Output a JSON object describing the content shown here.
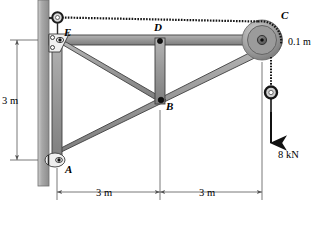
{
  "figure": {
    "background": "#ffffff"
  },
  "colors": {
    "member_fill": "#9a9a9a",
    "member_edge": "#3a3a3a",
    "wall_fill": "#a8a8a8",
    "wall_edge": "#6e6e6e",
    "pulley_outer": "#b8b8b8",
    "pulley_mid": "#8f8f8f",
    "pulley_hub": "#6a6a6a",
    "cable": "#1a1a1a",
    "dimension": "#555555",
    "text": "#000000"
  },
  "joints": [
    {
      "id": "E",
      "label": "E",
      "x": 57,
      "y": 40,
      "type": "pin-eyebolt"
    },
    {
      "id": "D",
      "label": "D",
      "x": 160,
      "y": 40,
      "type": "pin"
    },
    {
      "id": "C",
      "label": "C",
      "x": 262,
      "y": 40,
      "type": "pulley"
    },
    {
      "id": "B",
      "label": "B",
      "x": 160,
      "y": 100,
      "type": "pin"
    },
    {
      "id": "A",
      "label": "A",
      "x": 57,
      "y": 160,
      "type": "pin-support"
    }
  ],
  "members": [
    {
      "name": "top-chord-E-C",
      "from": "E",
      "to": "C"
    },
    {
      "name": "column-E-A",
      "from": "E",
      "to": "A"
    },
    {
      "name": "diagonal-E-B",
      "from": "E",
      "to": "B"
    },
    {
      "name": "vertical-D-B",
      "from": "D",
      "to": "B"
    },
    {
      "name": "diagonal-A-B-C",
      "from": "A",
      "to": "C"
    }
  ],
  "cable": {
    "name": "cable-E-C-load",
    "style": "beaded",
    "segments": [
      "E-to-pulley-top",
      "pulley-to-load"
    ]
  },
  "load": {
    "label": "8 kN",
    "direction": "down",
    "arrow_tip_y": 148,
    "x": 268
  },
  "pulley": {
    "label": "C",
    "radius_label": "0.1 m",
    "center_x": 262,
    "center_y": 40,
    "outer_r": 20,
    "inner_r": 14,
    "hub_r": 4
  },
  "dimensions": [
    {
      "name": "vertical-height",
      "text": "3 m",
      "orientation": "vertical",
      "from": "E",
      "to": "A"
    },
    {
      "name": "span-left",
      "text": "3 m",
      "orientation": "horizontal",
      "from": "A",
      "to": "B"
    },
    {
      "name": "span-right",
      "text": "3 m",
      "orientation": "horizontal",
      "from": "B",
      "to": "C"
    }
  ],
  "wall": {
    "name": "support-wall",
    "x": 38,
    "width": 11,
    "top": 0,
    "bottom": 186
  }
}
